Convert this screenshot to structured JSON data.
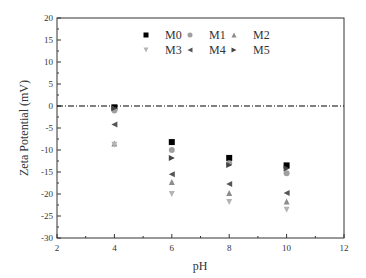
{
  "chart_data": {
    "type": "scatter",
    "title": "",
    "xlabel": "pH",
    "ylabel": "Zeta Potential (mV)",
    "xlim": [
      2,
      12
    ],
    "ylim": [
      -30,
      20
    ],
    "xticks": [
      2,
      4,
      6,
      8,
      10,
      12
    ],
    "yticks": [
      20,
      15,
      10,
      5,
      0,
      -5,
      -10,
      -15,
      -20,
      -25,
      -30
    ],
    "grid": false,
    "reference_line": {
      "y": 0,
      "style": "dash-dot",
      "color": "#000000"
    },
    "legend_position": "top-center (inside)",
    "x": [
      4,
      6,
      8,
      10
    ],
    "series": [
      {
        "name": "M0",
        "marker": "square",
        "color": "#000000",
        "values": [
          -0.3,
          -8.2,
          -11.8,
          -13.5
        ]
      },
      {
        "name": "M1",
        "marker": "circle",
        "color": "#a0a0a0",
        "values": [
          -1.0,
          -10.0,
          -13.0,
          -15.3
        ]
      },
      {
        "name": "M2",
        "marker": "triangle-up",
        "color": "#8c8c8c",
        "values": [
          -8.5,
          -17.3,
          -19.8,
          -21.7
        ]
      },
      {
        "name": "M3",
        "marker": "triangle-down",
        "color": "#b4b4b4",
        "values": [
          -8.8,
          -20.0,
          -21.8,
          -23.6
        ]
      },
      {
        "name": "M4",
        "marker": "triangle-left",
        "color": "#555555",
        "values": [
          -4.2,
          -15.5,
          -17.7,
          -19.8
        ]
      },
      {
        "name": "M5",
        "marker": "triangle-right",
        "color": "#444444",
        "values": [
          -0.5,
          -11.8,
          -13.4,
          -14.2
        ]
      }
    ]
  }
}
